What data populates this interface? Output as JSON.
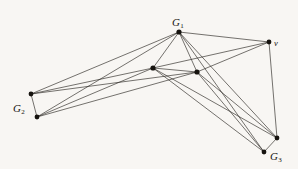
{
  "figure": {
    "background_color": "#f8f6f3",
    "edge_color": "#2b2824",
    "vertex_color": "#16130f",
    "label_color": "#17140f",
    "width": 298,
    "height": 169
  },
  "labels": [
    {
      "id": "G1",
      "main": "G",
      "sub": "1",
      "x": 172,
      "y": 13
    },
    {
      "id": "v",
      "main": "v",
      "sub": "",
      "x": 274,
      "y": 33
    },
    {
      "id": "G2",
      "main": "G",
      "sub": "2",
      "x": 13,
      "y": 99
    },
    {
      "id": "G3",
      "main": "G",
      "sub": "3",
      "x": 270,
      "y": 147
    }
  ],
  "graph_data": {
    "type": "node-link-diagram",
    "description": "Join of three graphs G1, G2, G3 with a distinguished vertex v",
    "vertices": [
      {
        "id": "g1a",
        "label": "G1",
        "x": 179,
        "y": 32,
        "r": 2.6
      },
      {
        "id": "g1b",
        "label": "",
        "x": 153,
        "y": 68,
        "r": 2.6
      },
      {
        "id": "g1c",
        "label": "",
        "x": 197,
        "y": 72,
        "r": 2.6
      },
      {
        "id": "v",
        "label": "v",
        "x": 269,
        "y": 42,
        "r": 2.4
      },
      {
        "id": "g2a",
        "label": "G2",
        "x": 31,
        "y": 94,
        "r": 2.4
      },
      {
        "id": "g2b",
        "label": "",
        "x": 37,
        "y": 117,
        "r": 2.4
      },
      {
        "id": "g3a",
        "label": "G3",
        "x": 277,
        "y": 138,
        "r": 2.4
      },
      {
        "id": "g3b",
        "label": "",
        "x": 264,
        "y": 152,
        "r": 2.4
      }
    ],
    "edges": [
      {
        "source": "g1a",
        "target": "g1b"
      },
      {
        "source": "g1a",
        "target": "g1c"
      },
      {
        "source": "g1b",
        "target": "g1c"
      },
      {
        "source": "g1a",
        "target": "v"
      },
      {
        "source": "g1b",
        "target": "v"
      },
      {
        "source": "g1c",
        "target": "v"
      },
      {
        "source": "g1a",
        "target": "g2a"
      },
      {
        "source": "g1a",
        "target": "g2b"
      },
      {
        "source": "g1b",
        "target": "g2a"
      },
      {
        "source": "g1b",
        "target": "g2b"
      },
      {
        "source": "g1c",
        "target": "g2a"
      },
      {
        "source": "g1c",
        "target": "g2b"
      },
      {
        "source": "g1a",
        "target": "g3a"
      },
      {
        "source": "g1a",
        "target": "g3b"
      },
      {
        "source": "g1b",
        "target": "g3a"
      },
      {
        "source": "g1b",
        "target": "g3b"
      },
      {
        "source": "g1c",
        "target": "g3a"
      },
      {
        "source": "g1c",
        "target": "g3b"
      },
      {
        "source": "g2a",
        "target": "g2b"
      },
      {
        "source": "g3a",
        "target": "g3b"
      },
      {
        "source": "v",
        "target": "g3a"
      }
    ]
  }
}
